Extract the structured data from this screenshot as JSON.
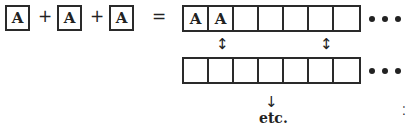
{
  "equation": {
    "terms": [
      "A",
      "A",
      "A"
    ],
    "plus": "+",
    "equals": "="
  },
  "top_row": {
    "cells": [
      "A",
      "A",
      "",
      "",
      "",
      "",
      ""
    ],
    "ellipsis": "•••"
  },
  "bottom_row": {
    "cells": [
      "",
      "",
      "",
      "",
      "",
      "",
      ""
    ],
    "ellipsis": "•••"
  },
  "arrows": {
    "swap": "↕",
    "down": "↓"
  },
  "footer": {
    "etc": "etc."
  },
  "margin_mark": "⁚"
}
